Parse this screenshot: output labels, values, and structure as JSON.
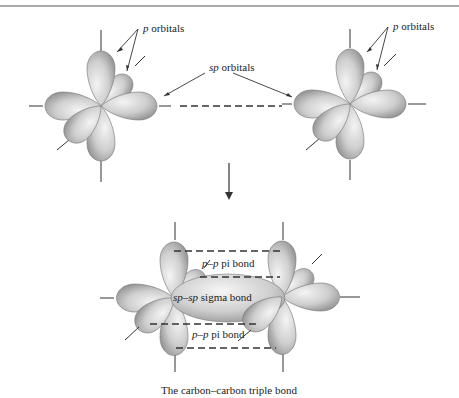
{
  "figure": {
    "top_rule": true,
    "labels": {
      "p_orbitals_left": "p orbitals",
      "p_orbitals_right": "p orbitals",
      "sp_orbitals": "sp orbitals",
      "pi_bond_top": "p–p pi bond",
      "sigma_bond": "sp–sp sigma bond",
      "pi_bond_bottom": "p–p pi bond"
    },
    "label_parts": {
      "p_italic": "p",
      "orbitals_word": "orbitals",
      "sp_italic": "sp",
      "pi_top_italic": "p–p",
      "pi_word": "pi bond",
      "sigma_italic": "sp–sp",
      "sigma_word": "sigma bond"
    },
    "caption": "The carbon–carbon triple bond",
    "colors": {
      "lobe_light": "#f2f2f2",
      "lobe_mid": "#c8c8c8",
      "lobe_dark": "#8f8f8f",
      "line": "#333333"
    }
  }
}
